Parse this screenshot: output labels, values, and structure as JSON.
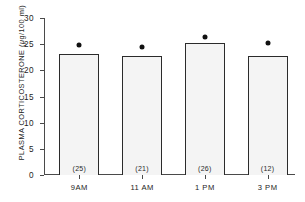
{
  "chart_data": {
    "type": "bar",
    "title": "",
    "xlabel": "",
    "ylabel_prefix": "PLASMA CORTICOSTERONE (",
    "ylabel_mu": "μ",
    "ylabel_suffix": "g/100 ml)",
    "ylabel_full": "PLASMA CORTICOSTERONE (μg/100 ml)",
    "categories": [
      "9AM",
      "11 AM",
      "1 PM",
      "3 PM"
    ],
    "values": [
      23.2,
      22.8,
      25.2,
      22.8
    ],
    "sample_labels": [
      "(25)",
      "(21)",
      "(26)",
      "(12)"
    ],
    "sample_sizes": [
      25,
      21,
      26,
      12
    ],
    "marker_values": [
      24.8,
      24.4,
      26.4,
      25.2
    ],
    "marker_symbol": "filled-circle",
    "ylim": [
      0,
      30
    ],
    "ytick_values": [
      0,
      5,
      10,
      15,
      20,
      25,
      30
    ],
    "ytick_labels": [
      "0",
      "5",
      "10",
      "15",
      "20",
      "25",
      "30"
    ],
    "grid": false,
    "legend": false,
    "bar_color": "#f4f4f4",
    "bar_edge_color": "#2b2b2b",
    "marker_color": "#111111",
    "axis_color": "#4a4a4a"
  }
}
